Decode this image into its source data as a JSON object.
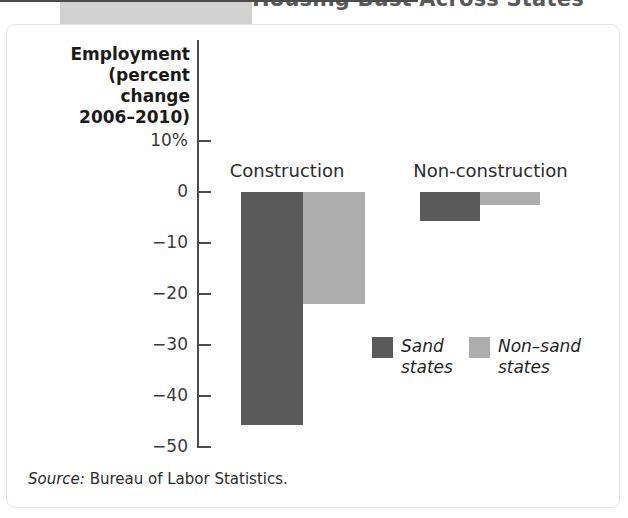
{
  "figure": {
    "title": "Housing Bust Across States",
    "source_label": "Source:",
    "source_text": "Bureau of Labor Statistics."
  },
  "colors": {
    "sand_states": "#5a5a5a",
    "non_sand_states": "#adadad",
    "axis": "#4c4c4c",
    "card_border": "#e3e3e3",
    "banner": "#d2d2d2",
    "title_text": "#58595b"
  },
  "chart_data": {
    "type": "bar",
    "title": "Housing Bust Across States",
    "xlabel": "",
    "ylabel": "Employment (percent change 2006–2010)",
    "ylabel_lines": [
      "Employment",
      "(percent change",
      "2006–2010)"
    ],
    "categories": [
      "Construction",
      "Non-construction"
    ],
    "series": [
      {
        "name": "Sand states",
        "name_lines": [
          "Sand",
          "states"
        ],
        "color": "#5a5a5a",
        "values": [
          -45.7,
          -5.7
        ]
      },
      {
        "name": "Non–sand states",
        "name_lines": [
          "Non–sand",
          "states"
        ],
        "color": "#adadad",
        "values": [
          -21.9,
          -2.6
        ]
      }
    ],
    "ylim": [
      -50,
      10
    ],
    "yticks": [
      10,
      0,
      -10,
      -20,
      -30,
      -40,
      -50
    ],
    "ytick_labels": [
      "10%",
      "0",
      "−10",
      "−20",
      "−30",
      "−40",
      "−50"
    ],
    "grid": false,
    "legend_position": "inside-center-right",
    "zero_line": true
  }
}
